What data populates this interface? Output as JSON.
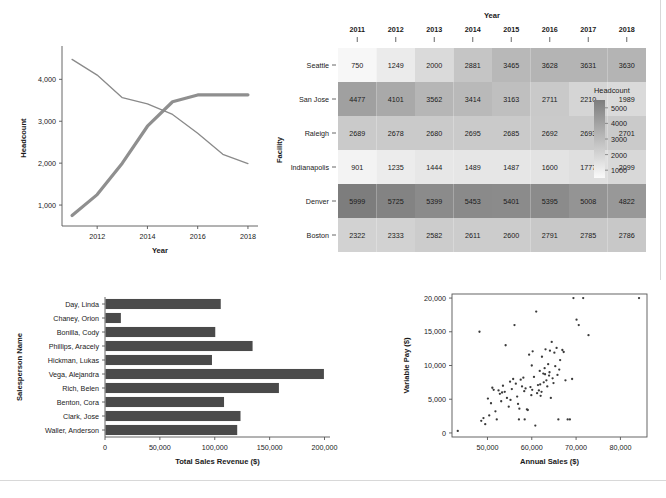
{
  "page": {
    "background": "#ffffff",
    "accent_dark": "#404040",
    "line_color_a": "#8f8f8f",
    "line_color_b": "#8a8a8a",
    "bar_color": "#4a4a4a",
    "point_color": "#3a3a3a"
  },
  "heatmap": {
    "title_x": "Year",
    "title_y": "Facility",
    "legend_title": "Headcount",
    "legend_ticks": [
      "5000",
      "4000",
      "3000",
      "2000",
      "1000"
    ],
    "columns": [
      "2011",
      "2012",
      "2013",
      "2014",
      "2015",
      "2016",
      "2017",
      "2018"
    ],
    "rows": [
      "Seattle",
      "San Jose",
      "Raleigh",
      "Indianapolis",
      "Denver",
      "Boston"
    ],
    "values": [
      [
        750,
        1249,
        2000,
        2881,
        3465,
        3628,
        3631,
        3630
      ],
      [
        4477,
        4101,
        3562,
        3414,
        3163,
        2711,
        2210,
        1989
      ],
      [
        2689,
        2678,
        2680,
        2695,
        2685,
        2692,
        2693,
        2701
      ],
      [
        901,
        1235,
        1444,
        1489,
        1487,
        1600,
        1777,
        2099
      ],
      [
        5999,
        5725,
        5399,
        5453,
        5401,
        5395,
        5008,
        4822
      ],
      [
        2322,
        2333,
        2582,
        2611,
        2600,
        2791,
        2785,
        2786
      ]
    ]
  },
  "chart_data": [
    {
      "type": "line",
      "title": "",
      "xlabel": "Year",
      "ylabel": "Headcount",
      "x": [
        2011,
        2012,
        2013,
        2014,
        2015,
        2016,
        2017,
        2018
      ],
      "xlim": [
        2010.6,
        2018.4
      ],
      "ylim": [
        500,
        4700
      ],
      "xticks": [
        "2012",
        "2014",
        "2016",
        "2018"
      ],
      "xtick_values": [
        2012,
        2014,
        2016,
        2018
      ],
      "yticks": [
        "1,000",
        "2,000",
        "3,000",
        "4,000"
      ],
      "ytick_values": [
        1000,
        2000,
        3000,
        4000
      ],
      "grid": false,
      "legend": "none",
      "series": [
        {
          "name": "Seattle",
          "values": [
            750,
            1249,
            2000,
            2881,
            3465,
            3628,
            3631,
            3630
          ],
          "width": 3.2
        },
        {
          "name": "San Jose",
          "values": [
            4477,
            4101,
            3562,
            3414,
            3163,
            2711,
            2210,
            1989
          ],
          "width": 1.3
        }
      ]
    },
    {
      "type": "bar",
      "orientation": "horizontal",
      "title": "",
      "xlabel": "Total Sales Revenue ($)",
      "ylabel": "Salesperson Name",
      "categories": [
        "Day, Linda",
        "Chaney, Orion",
        "Bonilla, Cody",
        "Phillips, Aracely",
        "Hickman, Lukas",
        "Vega, Alejandra",
        "Rich, Belen",
        "Benton, Cora",
        "Clark, Jose",
        "Waller, Anderson"
      ],
      "values": [
        105000,
        14000,
        100000,
        134000,
        97000,
        199000,
        158000,
        108000,
        123000,
        120000
      ],
      "xlim": [
        0,
        205000
      ],
      "xticks": [
        "0",
        "50,000",
        "100,000",
        "150,000",
        "200,000"
      ],
      "xtick_values": [
        0,
        50000,
        100000,
        150000,
        200000
      ],
      "grid": false
    },
    {
      "type": "scatter",
      "title": "",
      "xlabel": "Annual Sales ($)",
      "ylabel": "Variable Pay ($)",
      "xlim": [
        42000,
        86000
      ],
      "ylim": [
        -600,
        20600
      ],
      "xticks": [
        "50,000",
        "60,000",
        "70,000",
        "80,000"
      ],
      "xtick_values": [
        50000,
        60000,
        70000,
        80000
      ],
      "yticks": [
        "0",
        "5,000",
        "10,000",
        "15,000",
        "20,000"
      ],
      "ytick_values": [
        0,
        5000,
        10000,
        15000,
        20000
      ],
      "grid": false,
      "points": [
        [
          43300,
          300
        ],
        [
          48200,
          15000
        ],
        [
          48600,
          1800
        ],
        [
          49100,
          2200
        ],
        [
          49500,
          1300
        ],
        [
          50100,
          5100
        ],
        [
          50400,
          2600
        ],
        [
          50800,
          4400
        ],
        [
          51100,
          6700
        ],
        [
          51400,
          6400
        ],
        [
          51800,
          3200
        ],
        [
          52100,
          2000
        ],
        [
          52500,
          6300
        ],
        [
          52800,
          5800
        ],
        [
          53100,
          4700
        ],
        [
          53500,
          7000
        ],
        [
          53900,
          6100
        ],
        [
          54100,
          13000
        ],
        [
          54400,
          5200
        ],
        [
          54800,
          3900
        ],
        [
          55100,
          7600
        ],
        [
          55500,
          6500
        ],
        [
          55800,
          8000
        ],
        [
          56100,
          16000
        ],
        [
          56400,
          7300
        ],
        [
          56700,
          5400
        ],
        [
          56900,
          4300
        ],
        [
          57200,
          3600
        ],
        [
          57500,
          7900
        ],
        [
          57800,
          6900
        ],
        [
          58100,
          8200
        ],
        [
          58300,
          6200
        ],
        [
          58600,
          6600
        ],
        [
          58900,
          3500
        ],
        [
          59100,
          3400
        ],
        [
          59400,
          11600
        ],
        [
          59700,
          6800
        ],
        [
          60000,
          10000
        ],
        [
          60200,
          12100
        ],
        [
          60500,
          8300
        ],
        [
          60800,
          1100
        ],
        [
          61000,
          18000
        ],
        [
          61200,
          5900
        ],
        [
          61400,
          7100
        ],
        [
          61600,
          6300
        ],
        [
          61800,
          9200
        ],
        [
          62000,
          5500
        ],
        [
          62300,
          11300
        ],
        [
          62600,
          8800
        ],
        [
          62900,
          9600
        ],
        [
          63100,
          12400
        ],
        [
          63300,
          7800
        ],
        [
          63500,
          6900
        ],
        [
          63700,
          10200
        ],
        [
          63900,
          8500
        ],
        [
          64100,
          12200
        ],
        [
          64300,
          5200
        ],
        [
          64500,
          13500
        ],
        [
          64700,
          8100
        ],
        [
          64900,
          7400
        ],
        [
          65100,
          11900
        ],
        [
          65300,
          9900
        ],
        [
          65600,
          12600
        ],
        [
          65800,
          8600
        ],
        [
          66000,
          2000
        ],
        [
          66400,
          10800
        ],
        [
          66900,
          12300
        ],
        [
          67200,
          12000
        ],
        [
          67600,
          7800
        ],
        [
          68100,
          2000
        ],
        [
          68600,
          2000
        ],
        [
          69100,
          8000
        ],
        [
          69400,
          20000
        ],
        [
          70100,
          16800
        ],
        [
          70600,
          16000
        ],
        [
          71600,
          20000
        ],
        [
          72800,
          14500
        ],
        [
          84200,
          20000
        ],
        [
          57100,
          2000
        ],
        [
          58400,
          2000
        ],
        [
          60100,
          6400
        ],
        [
          62200,
          6100
        ],
        [
          63000,
          8700
        ],
        [
          64000,
          9000
        ],
        [
          61900,
          7200
        ],
        [
          59900,
          5600
        ],
        [
          55200,
          4900
        ],
        [
          53300,
          6000
        ],
        [
          62700,
          7500
        ],
        [
          66200,
          9400
        ]
      ]
    }
  ]
}
